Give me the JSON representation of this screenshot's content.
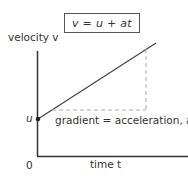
{
  "equation": "v = u + at",
  "axes": {
    "y_label": "velocity v",
    "x_label": "time t",
    "origin_label": "0",
    "intercept_label": "u"
  },
  "annotation": "gradient = acceleration, a",
  "colors": {
    "line": "#333333",
    "dashed": "#999999",
    "box_border": "#555555"
  }
}
